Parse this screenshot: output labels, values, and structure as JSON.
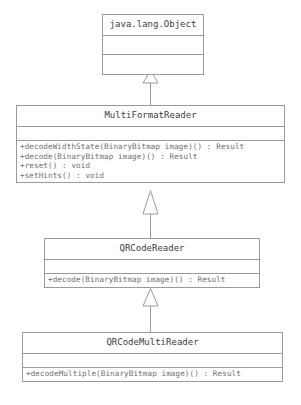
{
  "diagram": {
    "type": "uml-class-diagram",
    "title": "",
    "line_color": "#9a9a9a",
    "text_color": "#6e6e6e",
    "name_color": "#3b3b3b",
    "background": "#ffffff",
    "classes": [
      {
        "id": "object",
        "name": "java.lang.Object",
        "attributes": [],
        "operations": []
      },
      {
        "id": "multiformat",
        "name": "MultiFormatReader",
        "attributes": [],
        "operations": [
          "+decodeWidthState(BinaryBitmap image)() : Result",
          "+decode(BinaryBitmap image)() : Result",
          "+reset() : void",
          "+setHints() : void"
        ]
      },
      {
        "id": "qrcode",
        "name": "QRCodeReader",
        "attributes": [],
        "operations": [
          "+decode(BinaryBitmap image)() : Result"
        ]
      },
      {
        "id": "qrcodemulti",
        "name": "QRCodeMultiReader",
        "attributes": [],
        "operations": [
          "+decodeMultiple(BinaryBitmap image)() : Result"
        ]
      }
    ],
    "relationships": [
      {
        "id": "gen-multiformat-object",
        "type": "generalization",
        "from": "MultiFormatReader",
        "to": "java.lang.Object",
        "arrow": "hollow-triangle"
      },
      {
        "id": "gen-qrcode-multiformat",
        "type": "generalization",
        "from": "QRCodeReader",
        "to": "MultiFormatReader",
        "arrow": "hollow-triangle"
      },
      {
        "id": "gen-qrcodemulti-qrcode",
        "type": "generalization",
        "from": "QRCodeMultiReader",
        "to": "QRCodeReader",
        "arrow": "hollow-triangle"
      }
    ]
  }
}
